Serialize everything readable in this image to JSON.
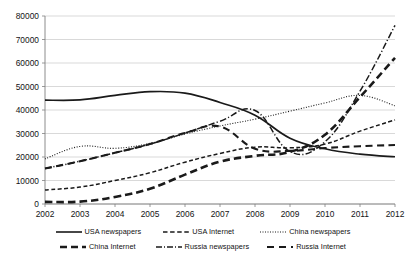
{
  "chart_data": {
    "type": "line",
    "title": "",
    "subtitle": "",
    "xlabel": "",
    "ylabel": "",
    "x": [
      2002,
      2003,
      2004,
      2005,
      2006,
      2007,
      2008,
      2009,
      2010,
      2011,
      2012
    ],
    "categories": [
      "2002",
      "2003",
      "2004",
      "2005",
      "2006",
      "2007",
      "2008",
      "2009",
      "2010",
      "2011",
      "2012"
    ],
    "xtick_labels": [
      "2002",
      "2003",
      "2004",
      "2005",
      "2006",
      "2007",
      "2008",
      "2009",
      "2010",
      "2011",
      "2012"
    ],
    "ytick_labels": [
      "0",
      "10000",
      "20000",
      "30000",
      "40000",
      "50000",
      "60000",
      "70000",
      "80000"
    ],
    "yticks": [
      0,
      10000,
      20000,
      30000,
      40000,
      50000,
      60000,
      70000,
      80000
    ],
    "ylim": [
      0,
      80000
    ],
    "xlim": [
      2002,
      2012
    ],
    "grid": "horizontal",
    "legend_position": "bottom",
    "series": [
      {
        "name": "USA newspapers",
        "style": "solid",
        "color": "#1a1a1a",
        "values": [
          44200,
          44300,
          46200,
          47800,
          47200,
          43200,
          37800,
          28000,
          23500,
          21200,
          20100
        ]
      },
      {
        "name": "USA Internet",
        "style": "dashed-fine",
        "color": "#1a1a1a",
        "values": [
          6000,
          7200,
          10000,
          13300,
          17800,
          21500,
          24200,
          23900,
          25500,
          31000,
          35800
        ]
      },
      {
        "name": "China newspapers",
        "style": "dotted",
        "color": "#1a1a1a",
        "values": [
          19200,
          24500,
          23700,
          25800,
          29800,
          33200,
          36100,
          39500,
          43000,
          46200,
          41800
        ]
      },
      {
        "name": "China Internet",
        "style": "dashed-thick",
        "color": "#1a1a1a",
        "values": [
          900,
          1000,
          3000,
          6500,
          12500,
          18000,
          20500,
          22200,
          29500,
          45500,
          62200
        ]
      },
      {
        "name": "Russia newspapers",
        "style": "dash-dot",
        "color": "#1a1a1a",
        "values": [
          15100,
          18200,
          21800,
          25500,
          30200,
          35200,
          39800,
          22300,
          26500,
          48000,
          76000
        ]
      },
      {
        "name": "Russia Internet",
        "style": "dashed-medium",
        "color": "#1a1a1a",
        "values": [
          15100,
          18200,
          21800,
          25500,
          30200,
          33000,
          23500,
          22600,
          23800,
          24600,
          25100
        ]
      }
    ],
    "legend_entries": [
      {
        "label": "USA newspapers",
        "style": "solid"
      },
      {
        "label": "USA Internet",
        "style": "dashed-fine"
      },
      {
        "label": "China newspapers",
        "style": "dotted"
      },
      {
        "label": "China Internet",
        "style": "dashed-thick"
      },
      {
        "label": "Russia newspapers",
        "style": "dash-dot"
      },
      {
        "label": "Russia Internet",
        "style": "dashed-medium"
      }
    ],
    "colors": {
      "ink": "#1a1a1a",
      "grid": "#c8c8c8",
      "axis": "#808080",
      "background": "#ffffff"
    }
  }
}
